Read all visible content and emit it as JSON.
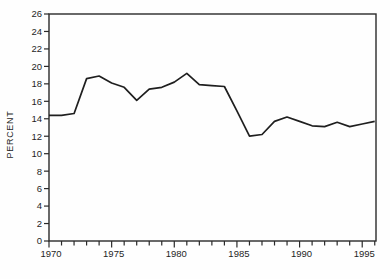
{
  "chart_data": {
    "type": "line",
    "title": "",
    "xlabel": "",
    "ylabel": "PERCENT",
    "x": [
      1970,
      1971,
      1972,
      1973,
      1974,
      1975,
      1976,
      1977,
      1978,
      1979,
      1980,
      1981,
      1982,
      1983,
      1984,
      1985,
      1986,
      1987,
      1988,
      1989,
      1990,
      1991,
      1992,
      1993,
      1994,
      1995,
      1996
    ],
    "values": [
      14.4,
      14.4,
      14.6,
      18.6,
      18.9,
      18.1,
      17.6,
      16.1,
      17.4,
      17.6,
      18.2,
      19.2,
      17.9,
      17.8,
      17.7,
      14.9,
      12.0,
      12.2,
      13.7,
      14.2,
      13.7,
      13.2,
      13.1,
      13.6,
      13.1,
      13.4,
      13.7
    ],
    "ylim": [
      0,
      26
    ],
    "ytick_step": 2,
    "ytick_labels": [
      "0",
      "2",
      "4",
      "6",
      "8",
      "10",
      "12",
      "14",
      "16",
      "18",
      "20",
      "22",
      "24",
      "26"
    ],
    "xlim": [
      1970,
      1996.1
    ],
    "xtick_step": 1,
    "xtick_labeled_years": [
      1970,
      1975,
      1980,
      1985,
      1990,
      1995
    ],
    "grid": false,
    "legend": "none",
    "line_color": "#1f1f1f",
    "axis_color": "#2a2a2a",
    "text_color": "#1f1f1f",
    "background_color": "#fefefe"
  },
  "layout": {
    "plot_left": 49,
    "plot_top": 14,
    "plot_right": 376,
    "plot_bottom": 241
  }
}
